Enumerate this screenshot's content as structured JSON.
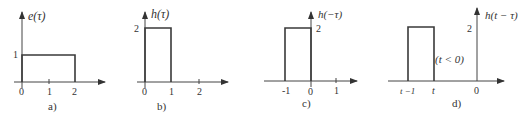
{
  "panels": [
    {
      "id": "a",
      "caption": "a)",
      "ylabel": "e(τ)",
      "ytick": "1",
      "xticks": [
        "0",
        "1",
        "2"
      ],
      "signal": {
        "type": "rect",
        "from": 0,
        "to": 2,
        "height": 1
      }
    },
    {
      "id": "b",
      "caption": "b)",
      "ylabel": "h(τ)",
      "ytick": "2",
      "xticks": [
        "0",
        "1",
        "2"
      ],
      "signal": {
        "type": "rect",
        "from": 0,
        "to": 1,
        "height": 2
      }
    },
    {
      "id": "c",
      "caption": "c)",
      "ylabel": "h(−τ)",
      "ytick": "2",
      "xticks": [
        "-1",
        "0",
        "1"
      ],
      "signal": {
        "type": "rect",
        "from": -1,
        "to": 0,
        "height": 2
      }
    },
    {
      "id": "d",
      "caption": "d)",
      "ylabel": "h(t − τ)",
      "ytick": "2",
      "xticks": [
        "t −1",
        "t",
        "0"
      ],
      "annotation": "(t < 0)",
      "signal": {
        "type": "rect",
        "from": "t-1",
        "to": "t",
        "height": 2
      }
    }
  ]
}
